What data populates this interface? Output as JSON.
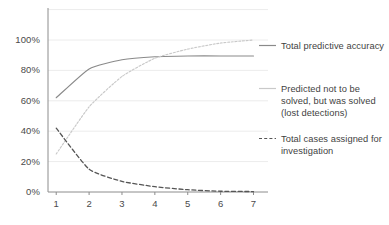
{
  "chart_data": {
    "type": "line",
    "title": "",
    "subtitle": "",
    "xlabel": "",
    "ylabel": "",
    "x": [
      1,
      2,
      3,
      4,
      5,
      6,
      7
    ],
    "xtick_labels": [
      "1",
      "2",
      "3",
      "4",
      "5",
      "6",
      "7"
    ],
    "ytick_labels": [
      "0%",
      "20%",
      "40%",
      "60%",
      "80%",
      "100%"
    ],
    "ytick_values": [
      0,
      20,
      40,
      60,
      80,
      100
    ],
    "xlim": [
      0.75,
      7.35
    ],
    "ylim": [
      0,
      120
    ],
    "grid": true,
    "grid_axis": "y",
    "legend_position": "right",
    "series": [
      {
        "name": "Total predictive accuracy",
        "style": "solid",
        "color": "#8a8a8a",
        "values": [
          62,
          81,
          87,
          89,
          89.5,
          89.5,
          89.5
        ]
      },
      {
        "name": "Predicted not to be solved, but was solved (lost detections)",
        "style": "dotted",
        "color": "#c9c9c9",
        "values": [
          25,
          56,
          76,
          88,
          94,
          98,
          100
        ]
      },
      {
        "name": "Total cases assigned for investigation",
        "style": "dashed",
        "color": "#555555",
        "values": [
          42,
          15,
          7,
          3.5,
          1.5,
          0.5,
          0.3
        ]
      }
    ]
  },
  "legend": {
    "entries": [
      {
        "label": "Total predictive accuracy",
        "marker": "solid-line-marker"
      },
      {
        "label": "Predicted not to be solved, but was solved (lost detections)",
        "marker": "faint-line-marker"
      },
      {
        "label": "Total cases assigned for investigation",
        "marker": "dashed-line-marker"
      }
    ]
  },
  "axes": {
    "y_labels": [
      "100%",
      "80%",
      "60%",
      "40%",
      "20%",
      "0%"
    ],
    "x_labels": [
      "1",
      "2",
      "3",
      "4",
      "5",
      "6",
      "7"
    ]
  },
  "colors": {
    "series_1": "#8a8a8a",
    "series_2": "#c9c9c9",
    "series_3": "#555555",
    "axis": "#7f7f7f",
    "grid": "#ececec",
    "text": "#3f3f3f"
  }
}
